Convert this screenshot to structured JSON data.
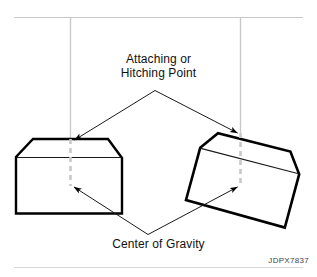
{
  "figure": {
    "code": "JDPX7837",
    "labels": {
      "attaching_line1": "Attaching or",
      "attaching_line2": "Hitching Point",
      "center_of_gravity": "Center of Gravity"
    },
    "colors": {
      "outline": "#000000",
      "thin_line": "#1a1a1a",
      "center_line": "#c9c9c9",
      "support_line": "#c9c9c9",
      "text": "#111111",
      "code_text": "#444444",
      "background": "#ffffff"
    },
    "elements": {
      "support_rail": "horizontal-support-rail",
      "left_hanger": "left-vertical-hanger-line",
      "right_hanger": "right-vertical-hanger-line",
      "left_crate": "level-crate",
      "right_crate": "tilted-crate",
      "left_center_line": "left-crate-center-line",
      "right_center_line": "right-crate-center-line",
      "leader_attaching_left": "leader-to-left-hitch-point",
      "leader_attaching_right": "leader-to-right-hitch-point",
      "leader_cog_left": "leader-to-left-center-of-gravity",
      "leader_cog_right": "leader-to-right-center-of-gravity"
    }
  }
}
